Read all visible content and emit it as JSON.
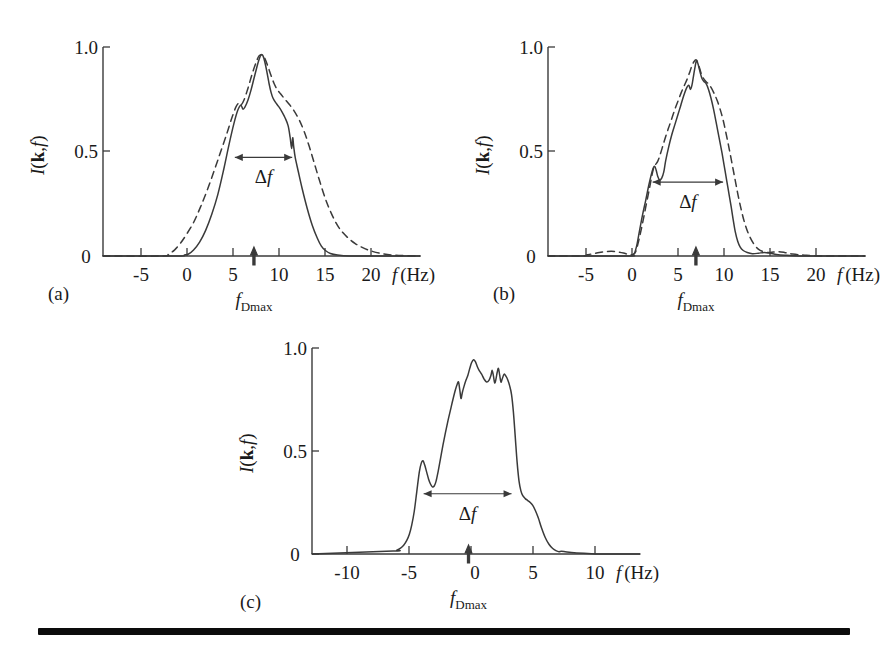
{
  "figure": {
    "background": "#ffffff",
    "ink_color": "#3a3a3a",
    "rule_color": "#0c0c0c"
  },
  "labels": {
    "y_axis_title": "I(k,f)",
    "x_axis_title": "f (Hz)",
    "delta_f": "Δf",
    "f_dmax": "f",
    "f_dmax_sub": "Dmax",
    "hz_unit": "(Hz)",
    "f_italic": "f",
    "I_italic": "I",
    "k_bold": "k",
    "paren_open": "(",
    "paren_close": ")",
    "comma": ","
  },
  "panels": [
    {
      "id": "a",
      "letter": "(a)",
      "f_dmax_value": 6.5,
      "delta_f_level": 0.5,
      "delta_f_from": 4.6,
      "delta_f_to": 10.3
    },
    {
      "id": "b",
      "letter": "(b)",
      "f_dmax_value": 6.2,
      "delta_f_level": 0.375,
      "delta_f_from": 1.9,
      "delta_f_to": 8.9
    },
    {
      "id": "c",
      "letter": "(c)",
      "f_dmax_value": -0.25,
      "delta_f_level": 0.31,
      "delta_f_from": -3.85,
      "delta_f_to": 3.2
    }
  ],
  "chart_data": [
    {
      "type": "line",
      "id": "a",
      "title": "(a)",
      "xlabel": "f (Hz)",
      "ylabel": "I(k,f)",
      "xlim": [
        -8.5,
        23.0
      ],
      "ylim": [
        0.0,
        1.06
      ],
      "xticks": [
        -5,
        0,
        5,
        10,
        15,
        20
      ],
      "yticks": [
        0,
        0.5,
        1.0
      ],
      "ytick_labels": [
        "0",
        "0.5",
        "1.0"
      ],
      "grid": false,
      "legend": "none",
      "annotations": [
        {
          "text": "Δf",
          "type": "double-arrow",
          "y": 0.5,
          "x_from": 4.6,
          "x_to": 10.3
        },
        {
          "text": "f_Dmax",
          "type": "up-arrow-marker",
          "x": 6.5,
          "y": 0
        }
      ],
      "series": [
        {
          "name": "measured",
          "style": "solid",
          "x": [
            -8.5,
            -1.2,
            -0.4,
            0.0,
            0.5,
            1.1,
            1.7,
            2.3,
            2.9,
            3.5,
            4.0,
            4.5,
            4.9,
            5.2,
            5.4,
            5.6,
            5.9,
            6.2,
            6.5,
            6.8,
            7.0,
            7.2,
            7.4,
            7.6,
            7.8,
            8.0,
            8.2,
            8.4,
            8.7,
            9.0,
            9.3,
            9.6,
            9.9,
            10.1,
            10.25,
            10.35,
            10.45,
            10.6,
            10.9,
            11.3,
            11.8,
            12.3,
            12.8,
            13.2,
            13.6,
            14.1,
            14.8,
            16.0,
            18.0,
            23.0
          ],
          "y": [
            0.0,
            0.0,
            0.005,
            0.01,
            0.03,
            0.07,
            0.13,
            0.21,
            0.31,
            0.44,
            0.56,
            0.67,
            0.74,
            0.765,
            0.745,
            0.755,
            0.79,
            0.84,
            0.9,
            0.96,
            0.995,
            1.02,
            1.015,
            0.98,
            0.93,
            0.875,
            0.83,
            0.8,
            0.775,
            0.755,
            0.73,
            0.7,
            0.66,
            0.6,
            0.545,
            0.6,
            0.555,
            0.5,
            0.43,
            0.34,
            0.24,
            0.155,
            0.09,
            0.05,
            0.028,
            0.013,
            0.005,
            0.0,
            0.0,
            0.0
          ]
        },
        {
          "name": "model",
          "style": "dashed",
          "x": [
            -8.5,
            -2.6,
            -2.0,
            -1.4,
            -0.8,
            -0.2,
            0.5,
            1.2,
            1.9,
            2.6,
            3.2,
            3.8,
            4.3,
            4.7,
            5.0,
            5.2,
            5.5,
            5.9,
            6.3,
            6.7,
            7.0,
            7.3,
            7.6,
            7.9,
            8.2,
            8.5,
            8.8,
            9.1,
            9.5,
            10.0,
            10.5,
            11.0,
            11.5,
            12.0,
            12.5,
            13.0,
            13.6,
            14.2,
            14.8,
            15.4,
            16.0,
            16.6,
            17.2,
            18.0,
            19.0,
            20.5,
            23.0
          ],
          "y": [
            0.0,
            0.0,
            0.01,
            0.03,
            0.065,
            0.11,
            0.17,
            0.25,
            0.34,
            0.44,
            0.53,
            0.62,
            0.7,
            0.755,
            0.775,
            0.765,
            0.79,
            0.85,
            0.92,
            0.98,
            1.015,
            1.02,
            1.0,
            0.96,
            0.915,
            0.875,
            0.845,
            0.825,
            0.8,
            0.77,
            0.735,
            0.69,
            0.63,
            0.555,
            0.47,
            0.385,
            0.29,
            0.215,
            0.155,
            0.115,
            0.085,
            0.062,
            0.045,
            0.028,
            0.014,
            0.004,
            0.0
          ]
        }
      ]
    },
    {
      "type": "line",
      "id": "b",
      "title": "(b)",
      "xlabel": "f (Hz)",
      "ylabel": "I(k,f)",
      "xlim": [
        -8.5,
        23.0
      ],
      "ylim": [
        0.0,
        1.06
      ],
      "xticks": [
        -5,
        0,
        5,
        10,
        15,
        20
      ],
      "yticks": [
        0,
        0.5,
        1.0
      ],
      "ytick_labels": [
        "0",
        "0.5",
        "1.0"
      ],
      "grid": false,
      "legend": "none",
      "annotations": [
        {
          "text": "Δf",
          "type": "double-arrow",
          "y": 0.375,
          "x_from": 1.9,
          "x_to": 8.9
        },
        {
          "text": "f_Dmax",
          "type": "up-arrow-marker",
          "x": 6.2,
          "y": 0
        }
      ],
      "series": [
        {
          "name": "measured",
          "style": "solid",
          "x": [
            -8.5,
            -0.6,
            -0.2,
            0.1,
            0.35,
            0.6,
            0.9,
            1.2,
            1.5,
            1.75,
            1.95,
            2.1,
            2.25,
            2.4,
            2.6,
            2.8,
            3.0,
            3.2,
            3.5,
            3.8,
            4.1,
            4.4,
            4.7,
            5.0,
            5.3,
            5.5,
            5.65,
            5.8,
            5.95,
            6.1,
            6.25,
            6.4,
            6.6,
            6.8,
            7.0,
            7.2,
            7.45,
            7.7,
            7.95,
            8.2,
            8.5,
            8.8,
            9.1,
            9.4,
            9.7,
            9.9,
            10.1,
            10.35,
            10.6,
            10.9,
            11.3,
            11.8,
            12.4,
            13.0,
            13.6,
            14.2,
            15.0,
            16.5,
            19.0,
            23.0
          ],
          "y": [
            0.0,
            0.0,
            0.005,
            0.015,
            0.06,
            0.13,
            0.21,
            0.28,
            0.355,
            0.41,
            0.445,
            0.455,
            0.435,
            0.405,
            0.385,
            0.395,
            0.425,
            0.485,
            0.555,
            0.615,
            0.665,
            0.715,
            0.765,
            0.815,
            0.855,
            0.865,
            0.845,
            0.865,
            0.91,
            0.955,
            0.99,
            0.975,
            0.935,
            0.9,
            0.885,
            0.875,
            0.845,
            0.8,
            0.745,
            0.68,
            0.6,
            0.52,
            0.43,
            0.34,
            0.25,
            0.185,
            0.125,
            0.075,
            0.045,
            0.028,
            0.018,
            0.012,
            0.014,
            0.018,
            0.014,
            0.008,
            0.004,
            0.0,
            0.0,
            0.0
          ]
        },
        {
          "name": "model",
          "style": "dashed",
          "x": [
            -8.5,
            -5.2,
            -4.6,
            -4.0,
            -3.4,
            -2.8,
            -2.2,
            -1.6,
            -1.0,
            -0.5,
            -0.1,
            0.2,
            0.5,
            0.85,
            1.2,
            1.55,
            1.85,
            2.05,
            2.2,
            2.4,
            2.65,
            2.95,
            3.25,
            3.55,
            3.85,
            4.15,
            4.45,
            4.75,
            5.05,
            5.35,
            5.6,
            5.8,
            6.0,
            6.2,
            6.35,
            6.55,
            6.8,
            7.1,
            7.4,
            7.7,
            8.0,
            8.3,
            8.6,
            8.9,
            9.2,
            9.5,
            9.8,
            10.1,
            10.4,
            10.7,
            11.0,
            11.4,
            11.9,
            12.4,
            12.9,
            13.4,
            13.9,
            14.4,
            15.0,
            15.8,
            17.0,
            19.0,
            23.0
          ],
          "y": [
            0.0,
            0.0,
            0.006,
            0.012,
            0.018,
            0.022,
            0.024,
            0.021,
            0.015,
            0.008,
            0.006,
            0.02,
            0.075,
            0.155,
            0.245,
            0.335,
            0.415,
            0.455,
            0.465,
            0.48,
            0.515,
            0.565,
            0.615,
            0.66,
            0.705,
            0.75,
            0.79,
            0.83,
            0.865,
            0.9,
            0.935,
            0.965,
            0.985,
            0.995,
            0.985,
            0.955,
            0.915,
            0.89,
            0.875,
            0.855,
            0.825,
            0.79,
            0.745,
            0.69,
            0.62,
            0.545,
            0.465,
            0.385,
            0.305,
            0.235,
            0.175,
            0.115,
            0.065,
            0.035,
            0.022,
            0.018,
            0.02,
            0.022,
            0.018,
            0.01,
            0.004,
            0.0,
            0.0
          ]
        }
      ]
    },
    {
      "type": "line",
      "id": "c",
      "title": "(c)",
      "xlabel": "f (Hz)",
      "ylabel": "I(k,f)",
      "xlim": [
        -12.8,
        13.5
      ],
      "ylim": [
        0.0,
        1.06
      ],
      "xticks": [
        -10,
        -5,
        0,
        5,
        10
      ],
      "yticks": [
        0,
        0.5,
        1.0
      ],
      "ytick_labels": [
        "0",
        "0.5",
        "1.0"
      ],
      "grid": false,
      "legend": "none",
      "annotations": [
        {
          "text": "Δf",
          "type": "double-arrow",
          "y": 0.31,
          "x_from": -3.85,
          "x_to": 3.2
        },
        {
          "text": "f_Dmax",
          "type": "up-arrow-marker",
          "x": -0.25,
          "y": 0
        }
      ],
      "series": [
        {
          "name": "measured",
          "style": "solid",
          "x": [
            -12.8,
            -6.3,
            -6.0,
            -5.7,
            -5.45,
            -5.2,
            -5.0,
            -4.8,
            -4.6,
            -4.4,
            -4.2,
            -4.05,
            -3.9,
            -3.75,
            -3.6,
            -3.45,
            -3.3,
            -3.15,
            -3.0,
            -2.85,
            -2.7,
            -2.5,
            -2.3,
            -2.1,
            -1.9,
            -1.7,
            -1.5,
            -1.3,
            -1.15,
            -1.05,
            -0.95,
            -0.85,
            -0.75,
            -0.6,
            -0.45,
            -0.3,
            -0.15,
            0.0,
            0.15,
            0.3,
            0.45,
            0.6,
            0.8,
            1.0,
            1.2,
            1.4,
            1.55,
            1.65,
            1.75,
            1.85,
            1.95,
            2.05,
            2.15,
            2.25,
            2.35,
            2.45,
            2.6,
            2.75,
            2.9,
            3.05,
            3.2,
            3.35,
            3.5,
            3.65,
            3.8,
            3.95,
            4.1,
            4.3,
            4.5,
            4.7,
            4.9,
            5.1,
            5.35,
            5.6,
            5.9,
            6.2,
            6.5,
            6.8,
            7.0,
            7.2,
            7.5,
            8.0,
            9.0,
            10.5,
            13.5
          ],
          "y": [
            0.0,
            0.015,
            0.02,
            0.03,
            0.045,
            0.07,
            0.1,
            0.15,
            0.22,
            0.32,
            0.42,
            0.465,
            0.48,
            0.455,
            0.42,
            0.385,
            0.36,
            0.345,
            0.35,
            0.375,
            0.42,
            0.49,
            0.56,
            0.625,
            0.685,
            0.74,
            0.795,
            0.845,
            0.875,
            0.885,
            0.845,
            0.8,
            0.83,
            0.865,
            0.895,
            0.92,
            0.955,
            0.985,
            1.0,
            0.99,
            0.965,
            0.945,
            0.925,
            0.9,
            0.885,
            0.895,
            0.92,
            0.945,
            0.915,
            0.88,
            0.9,
            0.935,
            0.955,
            0.92,
            0.885,
            0.9,
            0.925,
            0.915,
            0.895,
            0.865,
            0.82,
            0.73,
            0.6,
            0.47,
            0.375,
            0.325,
            0.3,
            0.285,
            0.275,
            0.265,
            0.25,
            0.225,
            0.185,
            0.135,
            0.085,
            0.05,
            0.028,
            0.016,
            0.012,
            0.014,
            0.012,
            0.008,
            0.004,
            0.0,
            0.0
          ]
        }
      ]
    }
  ]
}
